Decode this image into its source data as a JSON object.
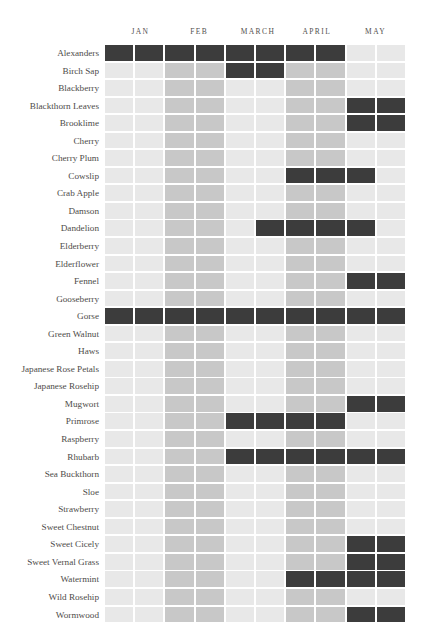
{
  "header": {
    "months": [
      "JAN",
      "FEB",
      "MARCH",
      "APRIL",
      "MAY"
    ]
  },
  "legend": {
    "shades": {
      "none": "#e8e8e8",
      "partial": "#c8c8c8",
      "peak": "#3c3c3c"
    }
  },
  "chart_data": {
    "type": "heatmap",
    "title": "",
    "xlabel": "",
    "ylabel": "",
    "columns": [
      "JAN-1",
      "JAN-2",
      "FEB-1",
      "FEB-2",
      "MARCH-1",
      "MARCH-2",
      "APRIL-1",
      "APRIL-2",
      "MAY-1",
      "MAY-2"
    ],
    "month_labels": [
      "JAN",
      "FEB",
      "MARCH",
      "APRIL",
      "MAY"
    ],
    "columns_per_month": 2,
    "value_scale": [
      0,
      1,
      2
    ],
    "value_colors": [
      "#e8e8e8",
      "#c8c8c8",
      "#3c3c3c"
    ],
    "value_names": [
      "none",
      "partial",
      "peak"
    ],
    "categories": [
      "Alexanders",
      "Birch Sap",
      "Blackberry",
      "Blackthorn Leaves",
      "Brooklime",
      "Cherry",
      "Cherry Plum",
      "Cowslip",
      "Crab Apple",
      "Damson",
      "Dandelion",
      "Elderberry",
      "Elderflower",
      "Fennel",
      "Gooseberry",
      "Gorse",
      "Green Walnut",
      "Haws",
      "Japanese Rose Petals",
      "Japanese Rosehip",
      "Mugwort",
      "Primrose",
      "Raspberry",
      "Rhubarb",
      "Sea Buckthorn",
      "Sloe",
      "Strawberry",
      "Sweet Chestnut",
      "Sweet Cicely",
      "Sweet Vernal Grass",
      "Watermint",
      "Wild Rosehip",
      "Wormwood"
    ],
    "rows": [
      {
        "name": "Alexanders",
        "values": [
          2,
          2,
          2,
          2,
          2,
          2,
          2,
          2,
          0,
          0
        ]
      },
      {
        "name": "Birch Sap",
        "values": [
          0,
          0,
          1,
          1,
          2,
          2,
          1,
          1,
          0,
          0
        ]
      },
      {
        "name": "Blackberry",
        "values": [
          0,
          0,
          1,
          1,
          0,
          0,
          1,
          1,
          0,
          0
        ]
      },
      {
        "name": "Blackthorn Leaves",
        "values": [
          0,
          0,
          1,
          1,
          0,
          0,
          1,
          1,
          2,
          2
        ]
      },
      {
        "name": "Brooklime",
        "values": [
          0,
          0,
          1,
          1,
          0,
          0,
          1,
          1,
          2,
          2
        ]
      },
      {
        "name": "Cherry",
        "values": [
          0,
          0,
          1,
          1,
          0,
          0,
          1,
          1,
          0,
          0
        ]
      },
      {
        "name": "Cherry Plum",
        "values": [
          0,
          0,
          1,
          1,
          0,
          0,
          1,
          1,
          0,
          0
        ]
      },
      {
        "name": "Cowslip",
        "values": [
          0,
          0,
          1,
          1,
          0,
          0,
          2,
          2,
          2,
          0
        ]
      },
      {
        "name": "Crab Apple",
        "values": [
          0,
          0,
          1,
          1,
          0,
          0,
          1,
          1,
          0,
          0
        ]
      },
      {
        "name": "Damson",
        "values": [
          0,
          0,
          1,
          1,
          0,
          0,
          1,
          1,
          0,
          0
        ]
      },
      {
        "name": "Dandelion",
        "values": [
          0,
          0,
          1,
          1,
          0,
          2,
          2,
          2,
          2,
          0
        ]
      },
      {
        "name": "Elderberry",
        "values": [
          0,
          0,
          1,
          1,
          0,
          0,
          1,
          1,
          0,
          0
        ]
      },
      {
        "name": "Elderflower",
        "values": [
          0,
          0,
          1,
          1,
          0,
          0,
          1,
          1,
          0,
          0
        ]
      },
      {
        "name": "Fennel",
        "values": [
          0,
          0,
          1,
          1,
          0,
          0,
          1,
          1,
          2,
          2
        ]
      },
      {
        "name": "Gooseberry",
        "values": [
          0,
          0,
          1,
          1,
          0,
          0,
          1,
          1,
          0,
          0
        ]
      },
      {
        "name": "Gorse",
        "values": [
          2,
          2,
          2,
          2,
          2,
          2,
          2,
          2,
          2,
          2
        ]
      },
      {
        "name": "Green Walnut",
        "values": [
          0,
          0,
          1,
          1,
          0,
          0,
          1,
          1,
          0,
          0
        ]
      },
      {
        "name": "Haws",
        "values": [
          0,
          0,
          1,
          1,
          0,
          0,
          1,
          1,
          0,
          0
        ]
      },
      {
        "name": "Japanese Rose Petals",
        "values": [
          0,
          0,
          1,
          1,
          0,
          0,
          1,
          1,
          0,
          0
        ]
      },
      {
        "name": "Japanese Rosehip",
        "values": [
          0,
          0,
          1,
          1,
          0,
          0,
          1,
          1,
          0,
          0
        ]
      },
      {
        "name": "Mugwort",
        "values": [
          0,
          0,
          1,
          1,
          0,
          0,
          1,
          1,
          2,
          2
        ]
      },
      {
        "name": "Primrose",
        "values": [
          0,
          0,
          1,
          1,
          2,
          2,
          2,
          2,
          0,
          0
        ]
      },
      {
        "name": "Raspberry",
        "values": [
          0,
          0,
          1,
          1,
          0,
          0,
          1,
          1,
          0,
          0
        ]
      },
      {
        "name": "Rhubarb",
        "values": [
          0,
          0,
          1,
          1,
          2,
          2,
          2,
          2,
          2,
          2
        ]
      },
      {
        "name": "Sea Buckthorn",
        "values": [
          0,
          0,
          1,
          1,
          0,
          0,
          1,
          1,
          0,
          0
        ]
      },
      {
        "name": "Sloe",
        "values": [
          0,
          0,
          1,
          1,
          0,
          0,
          1,
          1,
          0,
          0
        ]
      },
      {
        "name": "Strawberry",
        "values": [
          0,
          0,
          1,
          1,
          0,
          0,
          1,
          1,
          0,
          0
        ]
      },
      {
        "name": "Sweet Chestnut",
        "values": [
          0,
          0,
          1,
          1,
          0,
          0,
          1,
          1,
          0,
          0
        ]
      },
      {
        "name": "Sweet Cicely",
        "values": [
          0,
          0,
          1,
          1,
          0,
          0,
          1,
          1,
          2,
          2
        ]
      },
      {
        "name": "Sweet Vernal Grass",
        "values": [
          0,
          0,
          1,
          1,
          0,
          0,
          1,
          1,
          2,
          2
        ]
      },
      {
        "name": "Watermint",
        "values": [
          0,
          0,
          1,
          1,
          0,
          0,
          2,
          2,
          2,
          2
        ]
      },
      {
        "name": "Wild Rosehip",
        "values": [
          0,
          0,
          1,
          1,
          0,
          0,
          1,
          1,
          0,
          0
        ]
      },
      {
        "name": "Wormwood",
        "values": [
          0,
          0,
          1,
          1,
          0,
          0,
          1,
          1,
          2,
          2
        ]
      }
    ]
  }
}
